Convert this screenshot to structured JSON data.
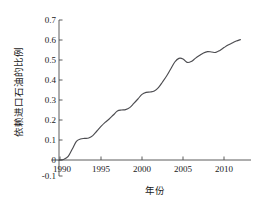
{
  "chart_data": {
    "type": "line",
    "title": "",
    "xlabel": "年份",
    "ylabel": "依赖进口石油的比例",
    "xlim": [
      1988.8,
      2012.6
    ],
    "ylim": [
      -0.1,
      0.7
    ],
    "xticks": [
      1990,
      1995,
      2000,
      2005,
      2010
    ],
    "xtick_labels": [
      "1990",
      "1995",
      "2000",
      "2005",
      "2010"
    ],
    "yticks": [
      -0.1,
      0,
      0.1,
      0.2,
      0.3,
      0.4,
      0.5,
      0.6,
      0.7
    ],
    "ytick_labels": [
      "-0.1",
      "0",
      "0.1",
      "0.2",
      "0.3",
      "0.4",
      "0.5",
      "0.6",
      "0.7"
    ],
    "grid": false,
    "legend": false,
    "legend_position": "none",
    "line_color": "#4c4c50",
    "axis_color": "#4a4a4a",
    "background_color": "#ffffff",
    "series": [
      {
        "name": "依赖进口石油的比例",
        "x": [
          1989.0,
          1989.5,
          1990.0,
          1990.5,
          1991.0,
          1991.5,
          1992.0,
          1992.5,
          1993.0,
          1993.5,
          1994.0,
          1994.5,
          1995.0,
          1995.5,
          1996.0,
          1996.5,
          1997.0,
          1997.5,
          1998.0,
          1998.5,
          1999.0,
          1999.5,
          2000.0,
          2000.5,
          2001.0,
          2001.5,
          2002.0,
          2002.5,
          2003.0,
          2003.5,
          2004.0,
          2004.5,
          2005.0,
          2005.5,
          2006.0,
          2006.5,
          2007.0,
          2007.5,
          2008.0,
          2008.5,
          2009.0,
          2009.5,
          2010.0,
          2010.5,
          2011.0,
          2011.5,
          2012.0
        ],
        "y": [
          0.0,
          0.0,
          0.0,
          0.004,
          0.018,
          0.055,
          0.093,
          0.105,
          0.108,
          0.11,
          0.122,
          0.145,
          0.168,
          0.188,
          0.205,
          0.225,
          0.245,
          0.25,
          0.252,
          0.262,
          0.283,
          0.305,
          0.328,
          0.338,
          0.34,
          0.345,
          0.362,
          0.39,
          0.42,
          0.455,
          0.49,
          0.508,
          0.505,
          0.488,
          0.492,
          0.508,
          0.522,
          0.535,
          0.542,
          0.54,
          0.538,
          0.548,
          0.562,
          0.575,
          0.585,
          0.595,
          0.602
        ]
      }
    ]
  }
}
